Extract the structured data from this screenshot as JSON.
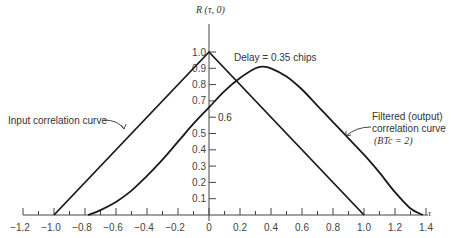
{
  "chart_data": {
    "type": "line",
    "title": "",
    "xlabel": "τ",
    "ylabel": "R (τ, 0)",
    "xlim": [
      -1.2,
      1.4
    ],
    "ylim": [
      0,
      1.0
    ],
    "grid": false,
    "legend": "none (curves labeled with annotations)",
    "x_ticks": [
      "-1.2",
      "-1.0",
      "-0.8",
      "-0.6",
      "-0.4",
      "-0.2",
      "0",
      "0.2",
      "0.4",
      "0.6",
      "0.8",
      "1.0",
      "1.2",
      "1.4"
    ],
    "y_ticks": [
      "0.1",
      "0.2",
      "0.3",
      "0.4",
      "0.5",
      "0.6",
      "0.7",
      "0.8",
      "0.9",
      "1.0"
    ],
    "series": [
      {
        "name": "Input correlation curve",
        "x": [
          -1.0,
          0.0,
          1.0
        ],
        "y": [
          0.0,
          1.0,
          0.0
        ]
      },
      {
        "name": "Filtered (output) correlation curve (BTc = 2)",
        "x": [
          -0.78,
          -0.7,
          -0.6,
          -0.5,
          -0.4,
          -0.3,
          -0.2,
          -0.1,
          0.0,
          0.1,
          0.2,
          0.3,
          0.35,
          0.4,
          0.5,
          0.6,
          0.7,
          0.8,
          0.9,
          1.0,
          1.1,
          1.2,
          1.3,
          1.38
        ],
        "y": [
          0.0,
          0.03,
          0.08,
          0.15,
          0.24,
          0.34,
          0.45,
          0.56,
          0.66,
          0.76,
          0.84,
          0.9,
          0.91,
          0.9,
          0.85,
          0.77,
          0.67,
          0.57,
          0.47,
          0.37,
          0.26,
          0.14,
          0.04,
          0.0
        ]
      }
    ],
    "annotations": [
      {
        "text": "Delay = 0.35 chips",
        "x": 0.35,
        "y": 0.91
      },
      {
        "text": "0.6",
        "x": 0.05,
        "y": 0.6
      },
      {
        "text": "Input correlation curve",
        "points_to": "input"
      },
      {
        "text": "Filtered (output)",
        "points_to": "filtered"
      },
      {
        "text": "correlation curve",
        "points_to": "filtered"
      },
      {
        "text": "(BTc = 2)",
        "points_to": "filtered"
      }
    ]
  },
  "labels": {
    "y_axis": "R (τ, 0)",
    "x_axis": "τ",
    "delay": "Delay = 0.35 chips",
    "mid_value": "0.6",
    "input_curve": "Input correlation curve",
    "filtered_line1": "Filtered (output)",
    "filtered_line2": "correlation curve",
    "filtered_line3": "(BTc = 2)"
  }
}
